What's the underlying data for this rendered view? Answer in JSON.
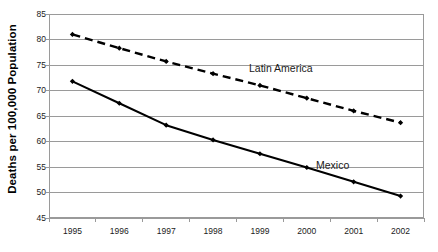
{
  "chart_data": {
    "type": "line",
    "title": "",
    "xlabel": "",
    "ylabel": "Deaths per 100,000 Population",
    "categories": [
      "1995",
      "1996",
      "1997",
      "1998",
      "1999",
      "2000",
      "2001",
      "2002"
    ],
    "ylim": [
      45,
      85
    ],
    "yticks": [
      45,
      50,
      55,
      60,
      65,
      70,
      75,
      80,
      85
    ],
    "grid": true,
    "legend_position": "inline-annotation",
    "series": [
      {
        "name": "Latin America",
        "values": [
          81.0,
          78.3,
          75.7,
          73.3,
          71.0,
          68.5,
          66.0,
          63.7
        ],
        "style": "dashed",
        "color": "#000000",
        "marker": "diamond",
        "annotation": "Latin America"
      },
      {
        "name": "Mexico",
        "values": [
          71.8,
          67.5,
          63.2,
          60.3,
          57.6,
          54.9,
          52.1,
          49.3
        ],
        "style": "solid",
        "color": "#000000",
        "marker": "diamond",
        "annotation": "Mexico"
      }
    ],
    "colors": {
      "gridline": "#9a9a9a",
      "axis": "#9a9a9a",
      "plot_border": "#9a9a9a",
      "background": "#ffffff",
      "text": "#1a1a1a",
      "series_line": "#000000"
    }
  },
  "axis": {
    "y_title": "Deaths per 100,000 Population",
    "y_ticks": [
      "85",
      "80",
      "75",
      "70",
      "65",
      "60",
      "55",
      "50",
      "45"
    ],
    "x_ticks": [
      "1995",
      "1996",
      "1997",
      "1998",
      "1999",
      "2000",
      "2001",
      "2002"
    ]
  },
  "annotations": {
    "latin_america": "Latin America",
    "mexico": "Mexico"
  }
}
